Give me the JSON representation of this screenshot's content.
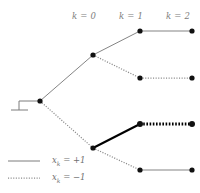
{
  "figure": {
    "type": "binary-decision-tree",
    "width": 200,
    "height": 193,
    "background": "#ffffff"
  },
  "colors": {
    "thin_line": "#7d7d7d",
    "dotted_line": "#8a8a8a",
    "bold_line": "#000000",
    "node": "#111111",
    "label_text": "#7d7d7d",
    "legend_text": "#6f6f6f"
  },
  "stage_labels": [
    {
      "id": "k0",
      "text": "k = 0",
      "x": 72,
      "y": 11
    },
    {
      "id": "k1",
      "text": "k = 1",
      "x": 119,
      "y": 11
    },
    {
      "id": "k2",
      "text": "k = 2",
      "x": 166,
      "y": 11
    }
  ],
  "legend": {
    "entries": [
      {
        "id": "plus-one",
        "style": "solid",
        "text": "x  = +1",
        "label_full": "x_k = +1",
        "sub": "k",
        "value": "+1",
        "y": 161
      },
      {
        "id": "minus-one",
        "style": "dotted",
        "text": "x  = −1",
        "label_full": "x_k = −1",
        "sub": "k",
        "value": "−1",
        "y": 178
      }
    ],
    "sample_line": {
      "x1": 8,
      "x2": 40
    }
  },
  "ground_symbol": {
    "name": "ground-terminal",
    "stem": {
      "x1": 38,
      "y1": 101,
      "x2": 19,
      "y2": 101
    },
    "post": {
      "x1": 19,
      "y1": 101,
      "x2": 19,
      "y2": 110
    },
    "bar": {
      "x1": 11,
      "y1": 110,
      "x2": 28,
      "y2": 110
    }
  },
  "nodes": [
    {
      "id": "root",
      "label": "root",
      "x": 40,
      "y": 101,
      "stage": 0,
      "r": 2.6
    },
    {
      "id": "n1p",
      "label": "k1-plus",
      "x": 93,
      "y": 55,
      "stage": 1,
      "r": 2.6
    },
    {
      "id": "n1m",
      "label": "k1-minus",
      "x": 93,
      "y": 148,
      "stage": 1,
      "r": 2.6
    },
    {
      "id": "n2pp",
      "label": "k2-plus-plus",
      "x": 140,
      "y": 31,
      "stage": 2,
      "r": 2.6
    },
    {
      "id": "n2pm",
      "label": "k2-plus-minus",
      "x": 140,
      "y": 78,
      "stage": 2,
      "r": 2.6
    },
    {
      "id": "n2mp",
      "label": "k2-minus-plus",
      "x": 140,
      "y": 124,
      "stage": 2,
      "r": 3.0
    },
    {
      "id": "n2mm",
      "label": "k2-minus-minus",
      "x": 140,
      "y": 170,
      "stage": 2,
      "r": 2.6
    },
    {
      "id": "t-pp",
      "label": "terminal-plus-plus",
      "x": 192,
      "y": 31,
      "stage": 3,
      "r": 2.6
    },
    {
      "id": "t-pm",
      "label": "terminal-plus-minus",
      "x": 192,
      "y": 78,
      "stage": 3,
      "r": 2.6
    },
    {
      "id": "t-mp",
      "label": "terminal-minus-plus",
      "x": 192,
      "y": 124,
      "stage": 3,
      "r": 3.0
    },
    {
      "id": "t-mm",
      "label": "terminal-minus-minus",
      "x": 192,
      "y": 170,
      "stage": 3,
      "r": 2.6
    }
  ],
  "edges": [
    {
      "id": "e-root-plus",
      "from": "root",
      "to": "n1p",
      "value": "+1",
      "style": "solid",
      "weight": "thin",
      "x1": 40,
      "y1": 101,
      "x2": 93,
      "y2": 55
    },
    {
      "id": "e-root-minus",
      "from": "root",
      "to": "n1m",
      "value": "−1",
      "style": "dotted",
      "weight": "thin",
      "x1": 40,
      "y1": 101,
      "x2": 93,
      "y2": 148
    },
    {
      "id": "e-n1p-plus",
      "from": "n1p",
      "to": "n2pp",
      "value": "+1",
      "style": "solid",
      "weight": "thin",
      "x1": 93,
      "y1": 55,
      "x2": 140,
      "y2": 31
    },
    {
      "id": "e-n1p-minus",
      "from": "n1p",
      "to": "n2pm",
      "value": "−1",
      "style": "dotted",
      "weight": "thin",
      "x1": 93,
      "y1": 55,
      "x2": 140,
      "y2": 78
    },
    {
      "id": "e-n1m-plus",
      "from": "n1m",
      "to": "n2mp",
      "value": "+1",
      "style": "solid",
      "weight": "bold",
      "x1": 93,
      "y1": 148,
      "x2": 140,
      "y2": 124
    },
    {
      "id": "e-n1m-minus",
      "from": "n1m",
      "to": "n2mm",
      "value": "−1",
      "style": "dotted",
      "weight": "thin",
      "x1": 93,
      "y1": 148,
      "x2": 140,
      "y2": 170
    },
    {
      "id": "e-tail-pp",
      "from": "n2pp",
      "to": "t-pp",
      "value": "+1",
      "style": "solid",
      "weight": "thin",
      "x1": 140,
      "y1": 31,
      "x2": 192,
      "y2": 31
    },
    {
      "id": "e-tail-pm",
      "from": "n2pm",
      "to": "t-pm",
      "value": "−1",
      "style": "dotted",
      "weight": "thin",
      "x1": 140,
      "y1": 78,
      "x2": 192,
      "y2": 78
    },
    {
      "id": "e-tail-mp",
      "from": "n2mp",
      "to": "t-mp",
      "value": "−1",
      "style": "dotted",
      "weight": "bold",
      "x1": 140,
      "y1": 124,
      "x2": 192,
      "y2": 124
    },
    {
      "id": "e-tail-mm",
      "from": "n2mm",
      "to": "t-mm",
      "value": "+1",
      "style": "solid",
      "weight": "thin",
      "x1": 140,
      "y1": 170,
      "x2": 192,
      "y2": 170
    }
  ]
}
